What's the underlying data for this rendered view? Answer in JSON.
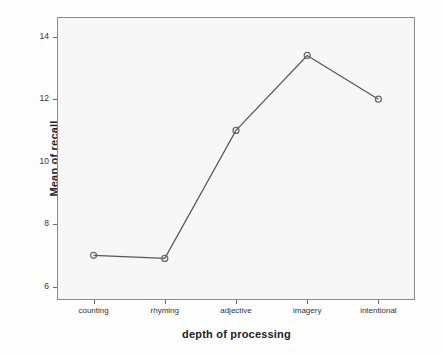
{
  "chart_data": {
    "type": "line",
    "title": "",
    "xlabel": "depth of processing",
    "ylabel": "Mean of recall",
    "categories": [
      "counting",
      "rhyming",
      "adjective",
      "imagery",
      "intentional"
    ],
    "values": [
      7.0,
      6.9,
      11.0,
      13.4,
      12.0
    ],
    "series": [
      {
        "name": "Mean of recall",
        "values": [
          7.0,
          6.9,
          11.0,
          13.4,
          12.0
        ]
      }
    ],
    "ylim": [
      5.6,
      14.6
    ],
    "y_ticks": [
      6,
      8,
      10,
      12,
      14
    ],
    "y_tick_labels": [
      "6",
      "8",
      "10",
      "12",
      "14"
    ],
    "grid": false,
    "legend": "none",
    "marker": "open-circle",
    "line_color": "#555555",
    "marker_color": "#666666",
    "plot_background": "#f7f7f7",
    "frame_color": "#8a8a8a"
  },
  "axes": {
    "y_title": "Mean of recall",
    "x_title": "depth of processing"
  }
}
